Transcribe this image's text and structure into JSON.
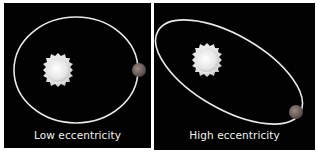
{
  "figure": {
    "panels": [
      {
        "id": "low",
        "caption": "Low eccentricity",
        "orbit": {
          "cx": 72,
          "cy": 67,
          "rx": 62,
          "ry": 53,
          "rotation_deg": 0
        },
        "star": {
          "cx": 54,
          "cy": 67,
          "r": 15
        },
        "planet": {
          "cx": 135,
          "cy": 67,
          "r": 7
        }
      },
      {
        "id": "high",
        "caption": "High eccentricity",
        "orbit": {
          "cx": 75,
          "cy": 69,
          "rx": 82,
          "ry": 37,
          "rotation_deg": 30
        },
        "star": {
          "cx": 53,
          "cy": 57,
          "r": 15
        },
        "planet": {
          "cx": 142,
          "cy": 109,
          "r": 7
        }
      }
    ],
    "colors": {
      "background": "#020202",
      "orbit": "#e8e8e8",
      "star": "#f4f4f4",
      "planet": "#7a6a66",
      "caption": "#f2f2f2"
    }
  }
}
